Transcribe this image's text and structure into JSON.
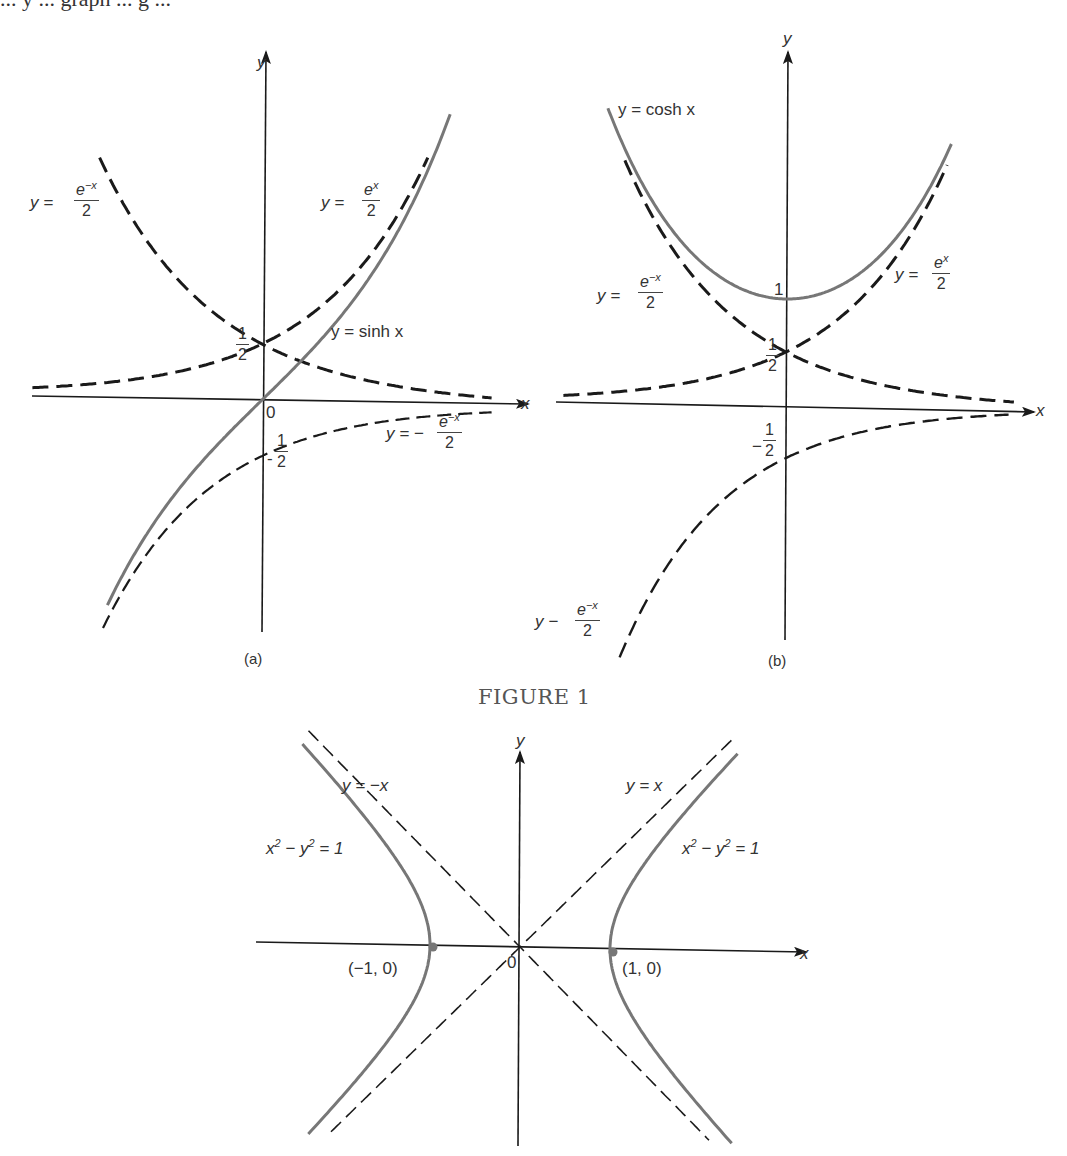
{
  "page": {
    "top_cropped_text": "... y ... graph ... g ...",
    "figure_title": "FIGURE 1"
  },
  "colors": {
    "axis": "#1a1a1a",
    "dashed_curve": "#1a1a1a",
    "solid_curve": "#777777",
    "text": "#333333"
  },
  "panel_a": {
    "caption": "(a)",
    "axis_x_label": "x",
    "axis_y_label": "y",
    "origin_label": "0",
    "half_label": {
      "num": "1",
      "den": "2"
    },
    "neg_half_label": {
      "sign": "-",
      "num": "1",
      "den": "2"
    },
    "labels": {
      "emx": {
        "lhs": "y =",
        "num": "e−x",
        "den": "2"
      },
      "ex": {
        "lhs": "y =",
        "num": "ex",
        "den": "2"
      },
      "sinh": "y = sinh x",
      "neg_emx": {
        "lhs": "y = −",
        "num": "e−x",
        "den": "2"
      }
    }
  },
  "panel_b": {
    "caption": "(b)",
    "axis_x_label": "x",
    "axis_y_label": "y",
    "one_label": "1",
    "half_label": {
      "num": "1",
      "den": "2"
    },
    "neg_half_label": {
      "sign": "−",
      "num": "1",
      "den": "2"
    },
    "labels": {
      "cosh": "y = cosh x",
      "emx": {
        "lhs": "y =",
        "num": "e−x",
        "den": "2"
      },
      "ex": {
        "lhs": "y =",
        "num": "ex",
        "den": "2"
      },
      "neg_emx": {
        "lhs": "y −",
        "num": "e−x",
        "den": "2"
      }
    }
  },
  "panel_c": {
    "axis_x_label": "x",
    "axis_y_label": "y",
    "origin_label": "0",
    "labels": {
      "neg_diag": "y = −x",
      "pos_diag": "y = x",
      "hyp_left": "x² − y² = 1",
      "hyp_right": "x² − y² = 1",
      "vertex_left": "(−1, 0)",
      "vertex_right": "(1, 0)"
    }
  },
  "chart_data": [
    {
      "type": "line",
      "title": "(a) y = sinh x with y = e^x/2 and y = -e^{-x}/2",
      "xlabel": "x",
      "ylabel": "y",
      "xlim": [
        -2.2,
        2.2
      ],
      "ylim": [
        -2.2,
        3.1
      ],
      "grid": false,
      "series": [
        {
          "name": "y = e^x/2",
          "style": "dashed",
          "x": [
            -2.0,
            -1.0,
            0.0,
            0.5,
            1.0,
            1.46
          ],
          "y": [
            0.068,
            0.184,
            0.5,
            0.824,
            1.359,
            2.15
          ]
        },
        {
          "name": "y = e^{-x}/2",
          "style": "dashed",
          "x": [
            -1.45,
            -1.0,
            0.0,
            1.0,
            2.0
          ],
          "y": [
            2.13,
            1.359,
            0.5,
            0.184,
            0.068
          ]
        },
        {
          "name": "y = -e^{-x}/2",
          "style": "dashed",
          "x": [
            -1.4,
            -1.0,
            0.0,
            1.0,
            2.0
          ],
          "y": [
            -2.03,
            -1.359,
            -0.5,
            -0.184,
            -0.068
          ]
        },
        {
          "name": "y = sinh x",
          "style": "solid",
          "x": [
            -1.4,
            -1.0,
            0.0,
            1.0,
            1.66
          ],
          "y": [
            -1.9,
            -1.175,
            0.0,
            1.175,
            2.54
          ]
        }
      ],
      "annotations": [
        "1/2",
        "-1/2",
        "0"
      ]
    },
    {
      "type": "line",
      "title": "(b) y = cosh x with y = e^x/2, y = e^{-x}/2",
      "xlabel": "x",
      "ylabel": "y",
      "xlim": [
        -2.2,
        2.2
      ],
      "ylim": [
        -2.2,
        3.0
      ],
      "grid": false,
      "series": [
        {
          "name": "y = e^x/2",
          "style": "dashed",
          "x": [
            -2.0,
            -1.0,
            0.0,
            1.0,
            1.5
          ],
          "y": [
            0.068,
            0.184,
            0.5,
            1.359,
            2.24
          ]
        },
        {
          "name": "y = e^{-x}/2",
          "style": "dashed",
          "x": [
            -1.5,
            -1.0,
            0.0,
            1.0,
            2.1
          ],
          "y": [
            2.24,
            1.359,
            0.5,
            0.184,
            0.061
          ]
        },
        {
          "name": "y = -e^{-x}/2",
          "style": "dashed",
          "x": [
            -1.55,
            -1.0,
            0.0,
            1.0,
            2.1
          ],
          "y": [
            -2.36,
            -1.359,
            -0.5,
            -0.184,
            -0.061
          ]
        },
        {
          "name": "y = cosh x",
          "style": "solid",
          "x": [
            -1.65,
            -1.0,
            0.0,
            1.0,
            1.55
          ],
          "y": [
            2.7,
            1.543,
            1.0,
            1.543,
            2.46
          ]
        }
      ],
      "annotations": [
        "1",
        "1/2",
        "-1/2"
      ]
    },
    {
      "type": "line",
      "title": "x^2 - y^2 = 1 with asymptotes y = x and y = -x",
      "xlabel": "x",
      "ylabel": "y",
      "xlim": [
        -2.9,
        3.2
      ],
      "ylim": [
        -2.2,
        2.3
      ],
      "grid": false,
      "series": [
        {
          "name": "x^2 - y^2 = 1 (right)",
          "style": "solid",
          "x": [
            2.3,
            1.41,
            1.0,
            1.41,
            2.25
          ],
          "y": [
            2.07,
            1.0,
            0.0,
            -1.0,
            -2.0
          ]
        },
        {
          "name": "x^2 - y^2 = 1 (left)",
          "style": "solid",
          "x": [
            -2.3,
            -1.41,
            -1.0,
            -1.41,
            -2.25
          ],
          "y": [
            2.07,
            1.0,
            0.0,
            -1.0,
            -2.0
          ]
        },
        {
          "name": "y = x",
          "style": "dashed",
          "x": [
            -2.0,
            0.0,
            2.3
          ],
          "y": [
            -2.0,
            0.0,
            2.3
          ]
        },
        {
          "name": "y = -x",
          "style": "dashed",
          "x": [
            -2.3,
            0.0,
            2.0
          ],
          "y": [
            2.3,
            0.0,
            -2.0
          ]
        }
      ],
      "points": [
        {
          "label": "(-1, 0)",
          "x": -1,
          "y": 0
        },
        {
          "label": "(1, 0)",
          "x": 1,
          "y": 0
        }
      ],
      "annotations": [
        "0"
      ]
    }
  ]
}
